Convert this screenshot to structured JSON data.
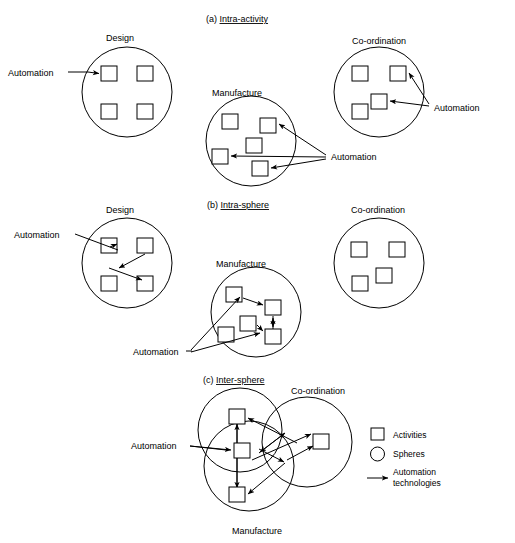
{
  "figure": {
    "background": "#ffffff",
    "ink": "#000000",
    "panels": [
      {
        "id": "a",
        "prefix": "(a)",
        "title": "Intra-activity",
        "title_pos": {
          "x": 206,
          "y": 22
        },
        "spheres": [
          {
            "name": "design",
            "label": "Design",
            "label_pos": {
              "x": 106,
              "y": 41
            },
            "cx": 127,
            "cy": 92,
            "r": 45,
            "activities": [
              {
                "x": 101,
                "y": 66,
                "w": 16,
                "h": 15
              },
              {
                "x": 137,
                "y": 66,
                "w": 16,
                "h": 15
              },
              {
                "x": 101,
                "y": 104,
                "w": 16,
                "h": 15
              },
              {
                "x": 137,
                "y": 104,
                "w": 16,
                "h": 15
              }
            ]
          },
          {
            "name": "manufacture",
            "label": "Manufacture",
            "label_pos": {
              "x": 212,
              "y": 96
            },
            "cx": 251,
            "cy": 141,
            "r": 45,
            "activities": [
              {
                "x": 222,
                "y": 114,
                "w": 16,
                "h": 15
              },
              {
                "x": 260,
                "y": 118,
                "w": 16,
                "h": 15
              },
              {
                "x": 246,
                "y": 138,
                "w": 16,
                "h": 15
              },
              {
                "x": 212,
                "y": 149,
                "w": 16,
                "h": 15
              },
              {
                "x": 252,
                "y": 161,
                "w": 16,
                "h": 15
              }
            ]
          },
          {
            "name": "co-ordination",
            "label": "Co-ordination",
            "label_pos": {
              "x": 352,
              "y": 44
            },
            "cx": 379,
            "cy": 92,
            "r": 45,
            "activities": [
              {
                "x": 352,
                "y": 66,
                "w": 16,
                "h": 15
              },
              {
                "x": 390,
                "y": 66,
                "w": 16,
                "h": 15
              },
              {
                "x": 371,
                "y": 94,
                "w": 16,
                "h": 15
              },
              {
                "x": 352,
                "y": 104,
                "w": 16,
                "h": 15
              }
            ]
          }
        ],
        "callouts": [
          {
            "name": "automation-design",
            "label": "Automation",
            "label_pos": {
              "x": 8,
              "y": 76
            }
          },
          {
            "name": "automation-manufacture",
            "label": "Automation",
            "label_pos": {
              "x": 331,
              "y": 160
            }
          },
          {
            "name": "automation-coordination",
            "label": "Automation",
            "label_pos": {
              "x": 434,
              "y": 111
            }
          }
        ]
      },
      {
        "id": "b",
        "prefix": "(b)",
        "title": "Intra-sphere",
        "title_pos": {
          "x": 207,
          "y": 208
        },
        "spheres": [
          {
            "name": "design",
            "label": "Design",
            "label_pos": {
              "x": 106,
              "y": 213
            },
            "cx": 127,
            "cy": 263,
            "r": 45,
            "activities": [
              {
                "x": 101,
                "y": 238,
                "w": 16,
                "h": 15
              },
              {
                "x": 137,
                "y": 238,
                "w": 16,
                "h": 15
              },
              {
                "x": 101,
                "y": 276,
                "w": 16,
                "h": 15
              },
              {
                "x": 137,
                "y": 276,
                "w": 16,
                "h": 15
              }
            ]
          },
          {
            "name": "manufacture",
            "label": "Manufacture",
            "label_pos": {
              "x": 216,
              "y": 267
            },
            "cx": 256,
            "cy": 312,
            "r": 45,
            "activities": [
              {
                "x": 226,
                "y": 287,
                "w": 16,
                "h": 15
              },
              {
                "x": 265,
                "y": 300,
                "w": 16,
                "h": 15
              },
              {
                "x": 240,
                "y": 316,
                "w": 16,
                "h": 15
              },
              {
                "x": 218,
                "y": 327,
                "w": 16,
                "h": 15
              },
              {
                "x": 265,
                "y": 329,
                "w": 16,
                "h": 15
              }
            ]
          },
          {
            "name": "co-ordination",
            "label": "Co-ordination",
            "label_pos": {
              "x": 351,
              "y": 213
            },
            "cx": 379,
            "cy": 263,
            "r": 45,
            "activities": [
              {
                "x": 351,
                "y": 242,
                "w": 16,
                "h": 15
              },
              {
                "x": 389,
                "y": 242,
                "w": 16,
                "h": 15
              },
              {
                "x": 376,
                "y": 268,
                "w": 16,
                "h": 15
              },
              {
                "x": 352,
                "y": 276,
                "w": 16,
                "h": 15
              }
            ]
          }
        ],
        "callouts": [
          {
            "name": "automation-design",
            "label": "Automation",
            "label_pos": {
              "x": 14,
              "y": 238
            }
          },
          {
            "name": "automation-manufacture",
            "label": "Automation",
            "label_pos": {
              "x": 133,
              "y": 355
            }
          }
        ]
      },
      {
        "id": "c",
        "prefix": "(c)",
        "title": "Inter-sphere",
        "title_pos": {
          "x": 203,
          "y": 383
        },
        "spheres": [
          {
            "name": "design",
            "label": "Design",
            "label_pos": null,
            "cx": 240,
            "cy": 430,
            "r": 42
          },
          {
            "name": "co-ordination",
            "label": "Co-ordination",
            "label_pos": {
              "x": 291,
              "y": 394
            },
            "cx": 307,
            "cy": 442,
            "r": 45
          },
          {
            "name": "manufacture",
            "label": "Manufacture",
            "label_pos": {
              "x": 232,
              "y": 534
            },
            "cx": 249,
            "cy": 466,
            "r": 45
          }
        ],
        "activities": [
          {
            "x": 229,
            "y": 409,
            "w": 16,
            "h": 15
          },
          {
            "x": 234,
            "y": 443,
            "w": 16,
            "h": 15
          },
          {
            "x": 313,
            "y": 434,
            "w": 16,
            "h": 15
          },
          {
            "x": 229,
            "y": 487,
            "w": 16,
            "h": 15
          }
        ],
        "callouts": [
          {
            "name": "automation",
            "label": "Automation",
            "label_pos": {
              "x": 131,
              "y": 449
            }
          }
        ]
      }
    ],
    "legend": {
      "name": "legend",
      "items": [
        {
          "name": "legend-activities",
          "glyph": "square-icon",
          "label": "Activities",
          "label2": ""
        },
        {
          "name": "legend-spheres",
          "glyph": "circle-icon",
          "label": "Spheres",
          "label2": ""
        },
        {
          "name": "legend-automation",
          "glyph": "arrow-icon",
          "label": "Automation",
          "label2": "technologies"
        }
      ]
    }
  }
}
